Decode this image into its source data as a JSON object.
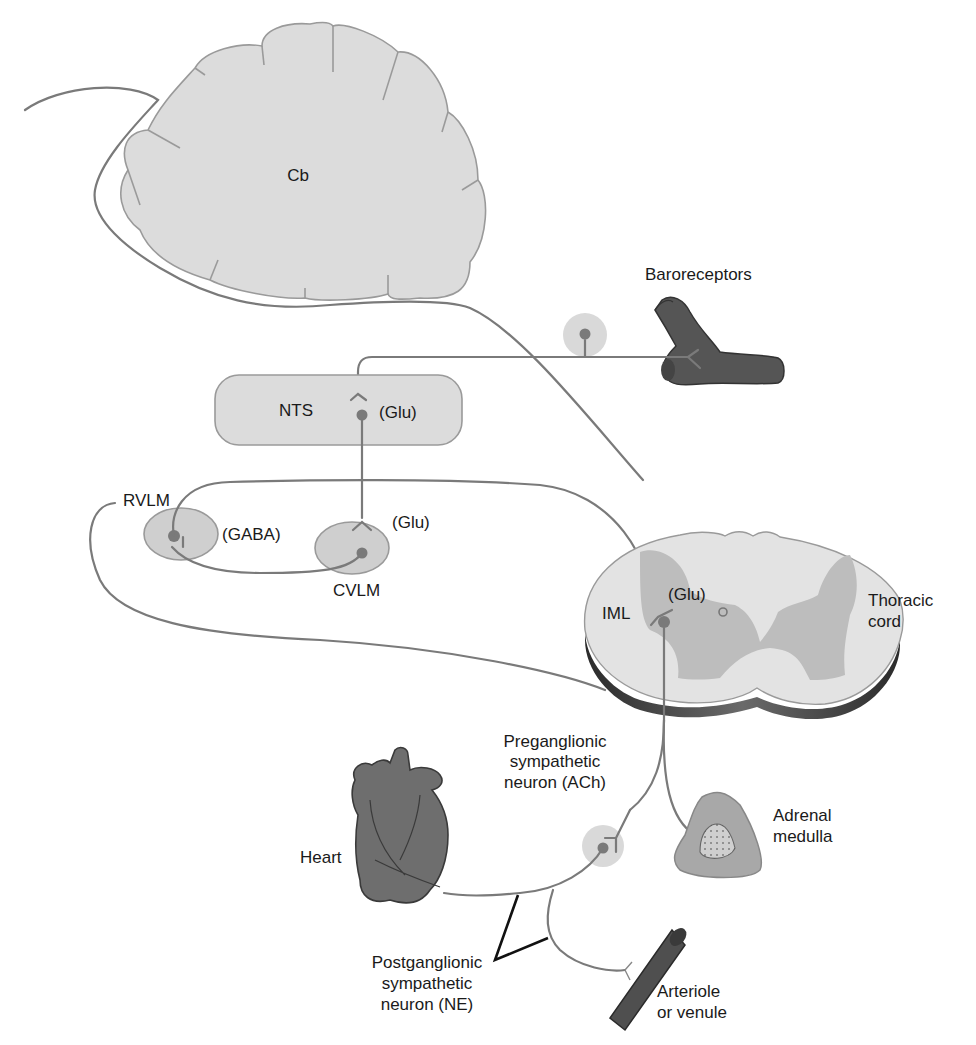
{
  "diagram": {
    "colors": {
      "region_fill": "#dcdcdc",
      "region_stroke": "#9a9a9a",
      "nerve": "#7a7a7a",
      "organ_dark": "#555555",
      "heart": "#6e6e6e",
      "gray_matter": "#bdbdbd",
      "halo": "#d9d9d9"
    },
    "structures": {
      "cerebellum": "Cb",
      "nts": "NTS",
      "rvlm": "RVLM",
      "cvlm": "CVLM",
      "iml": "IML",
      "thoracic_cord": [
        "Thoracic",
        "cord"
      ],
      "baroreceptors": "Baroreceptors",
      "heart": "Heart",
      "adrenal_medulla": [
        "Adrenal",
        "medulla"
      ],
      "arteriole": [
        "Arteriole",
        "or venule"
      ]
    },
    "neurotransmitters": {
      "nts": "(Glu)",
      "rvlm": "(GABA)",
      "cvlm": "(Glu)",
      "iml": "(Glu)"
    },
    "neurons": {
      "preganglionic": [
        "Preganglionic",
        "sympathetic",
        "neuron (ACh)"
      ],
      "postganglionic": [
        "Postganglionic",
        "sympathetic",
        "neuron (NE)"
      ]
    }
  }
}
